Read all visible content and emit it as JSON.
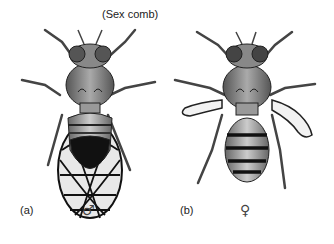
{
  "figure": {
    "annotation": "(Sex comb)",
    "panels": [
      {
        "id": "a",
        "label": "(a)",
        "sex_symbol": "♂",
        "description": "male fly, wings folded over abdomen, dark abdomen tip"
      },
      {
        "id": "b",
        "label": "(b)",
        "sex_symbol": "♀",
        "description": "female fly, vestigial crumpled wings, banded abdomen"
      }
    ]
  }
}
